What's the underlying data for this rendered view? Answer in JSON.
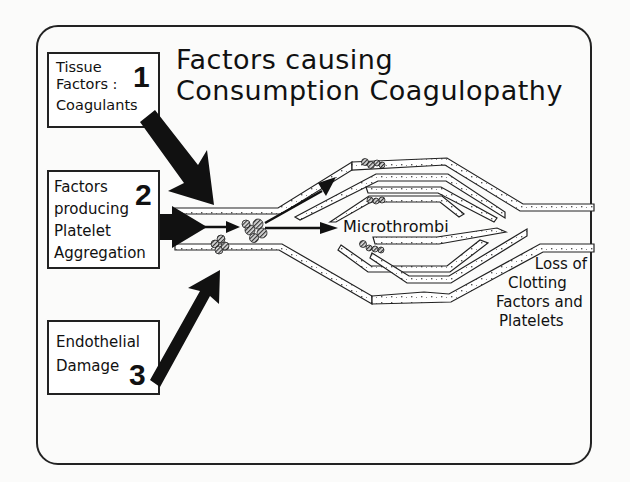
{
  "title": {
    "line1": "Factors causing",
    "line2": "Consumption Coagulopathy"
  },
  "factors": [
    {
      "number": "1",
      "lines": [
        "Tissue",
        "Factors :",
        "Coagulants"
      ]
    },
    {
      "number": "2",
      "lines": [
        "Factors",
        "producing",
        "Platelet",
        "Aggregation"
      ]
    },
    {
      "number": "3",
      "lines": [
        "Endothelial",
        "Damage"
      ]
    }
  ],
  "labels": {
    "microthrombi": "Microthrombi",
    "loss": [
      "Loss of",
      "Clotting",
      "Factors and",
      "Platelets"
    ]
  },
  "colors": {
    "ink": "#111111",
    "paper": "#fbfbfa"
  }
}
